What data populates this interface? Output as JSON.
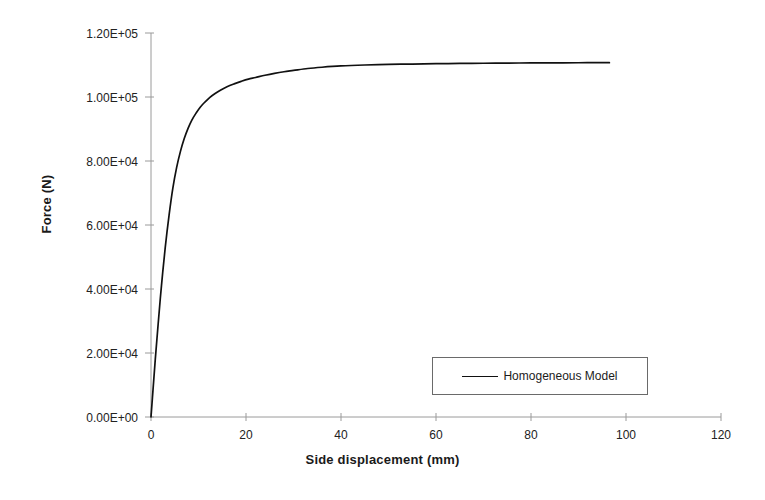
{
  "chart_data": {
    "type": "line",
    "title": "",
    "subtitle": "",
    "xlabel": "Side displacement (mm)",
    "ylabel": "Force (N)",
    "xlim": [
      0,
      120
    ],
    "ylim": [
      0,
      120000
    ],
    "grid": false,
    "legend_position": "inside-lower-right",
    "x_ticks": [
      0,
      20,
      40,
      60,
      80,
      100,
      120
    ],
    "x_tick_labels": [
      "0",
      "20",
      "40",
      "60",
      "80",
      "100",
      "120"
    ],
    "y_ticks": [
      0,
      20000,
      40000,
      60000,
      80000,
      100000,
      120000
    ],
    "y_tick_labels": [
      "0.00E+00",
      "2.00E+04",
      "4.00E+04",
      "6.00E+04",
      "8.00E+04",
      "1.00E+05",
      "1.20E+05"
    ],
    "series": [
      {
        "name": "Homogeneous Model",
        "color": "#111111",
        "x": [
          0,
          0.4,
          0.9,
          1.5,
          2.2,
          3.0,
          3.8,
          4.6,
          5.4,
          6.2,
          7.0,
          7.8,
          8.6,
          9.5,
          10.4,
          11.4,
          12.4,
          13.5,
          14.7,
          16.0,
          17.5,
          19.0,
          20.5,
          22.0,
          24.0,
          26.0,
          28.0,
          30.0,
          33.0,
          36.0,
          40.0,
          45.0,
          50.0,
          55.0,
          60.0,
          65.0,
          70.0,
          75.0,
          80.0,
          85.0,
          90.0,
          93.0,
          96.5
        ],
        "y": [
          0,
          8000,
          18000,
          29000,
          41000,
          53000,
          63000,
          71500,
          78000,
          83000,
          87000,
          90200,
          92800,
          95000,
          96900,
          98500,
          99900,
          101100,
          102200,
          103200,
          104100,
          104900,
          105600,
          106100,
          106800,
          107400,
          107900,
          108300,
          108900,
          109300,
          109700,
          110000,
          110200,
          110300,
          110400,
          110500,
          110550,
          110600,
          110650,
          110680,
          110700,
          110720,
          110740
        ]
      }
    ],
    "legend": [
      {
        "label": "Homogeneous Model",
        "color": "#111111"
      }
    ],
    "annotations": []
  },
  "axes": {
    "axis_line_color": "#9a9a9a",
    "tick_color": "#9a9a9a",
    "text_color": "#222222"
  },
  "legend_panel": {
    "border_color": "#6a6a6a",
    "background": "#ffffff"
  }
}
